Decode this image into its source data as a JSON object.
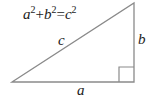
{
  "diagram": {
    "type": "right-triangle",
    "formula": {
      "a": "a",
      "a_exp": "2",
      "plus": "+",
      "b": "b",
      "b_exp": "2",
      "equals": "=",
      "c": "c",
      "c_exp": "2"
    },
    "labels": {
      "hypotenuse": "c",
      "vertical_leg": "b",
      "horizontal_leg": "a"
    },
    "colors": {
      "line": "#8a8a8a",
      "text": "#222222",
      "background": "#ffffff"
    }
  }
}
